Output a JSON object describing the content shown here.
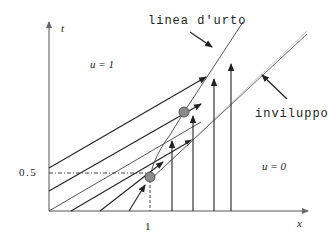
{
  "figure": {
    "axes": {
      "x_label": "x",
      "y_label": "t",
      "x_tick": "1",
      "y_tick": "0.5"
    },
    "regions": {
      "left_state": "u = 1",
      "right_state": "u = 0"
    },
    "annotations": {
      "shock": "linea d'urto",
      "envelope": "inviluppo"
    },
    "markers": [
      {
        "name": "shock-start",
        "x": 1,
        "t": 0.5
      },
      {
        "name": "shock-point"
      }
    ],
    "colors": {
      "ink": "#222222",
      "marker_fill": "#8a8a8a",
      "envelope": "#555555"
    }
  }
}
